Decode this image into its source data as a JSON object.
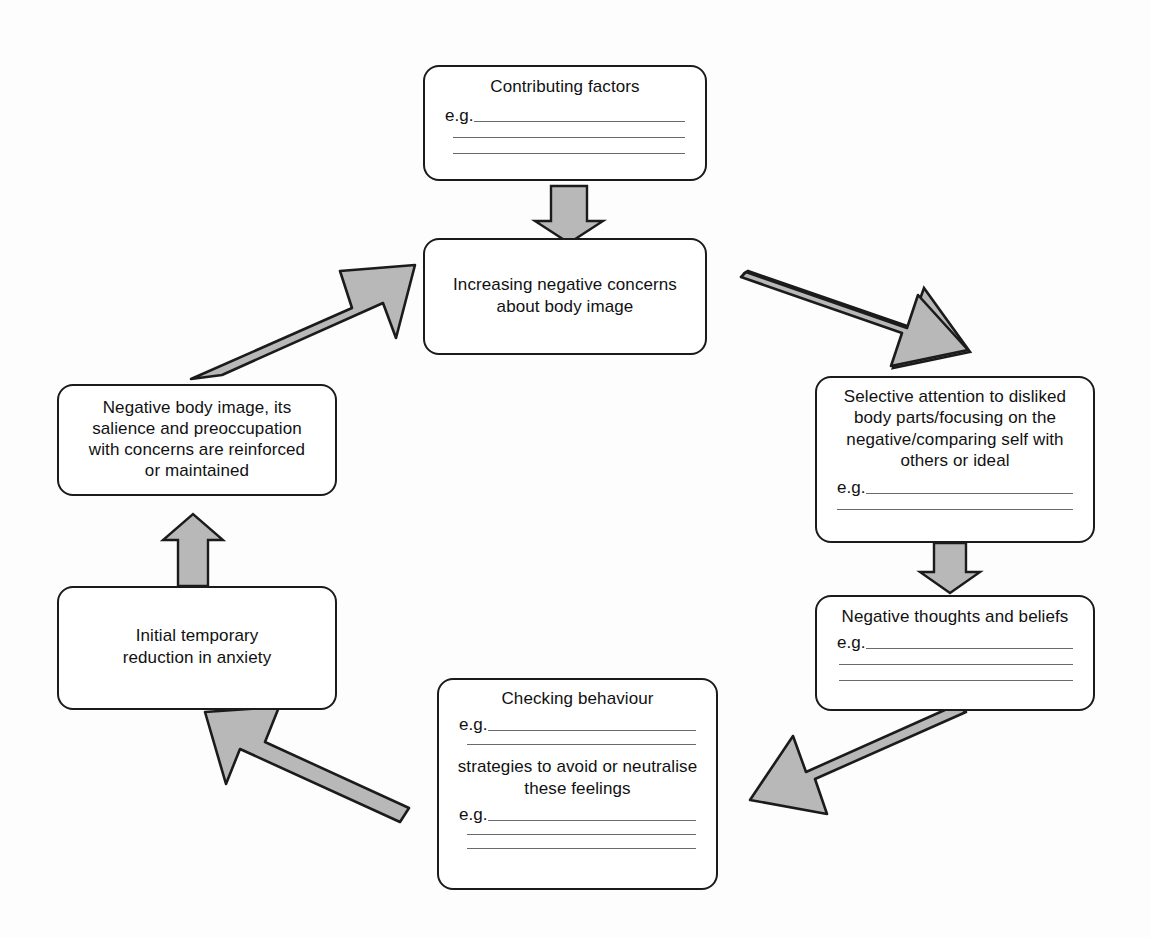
{
  "diagram": {
    "style": {
      "box_border": "#1b1b1b",
      "box_fill": "#ffffff",
      "arrow_fill": "#b8b8b8",
      "arrow_stroke": "#1b1b1b",
      "rule_color": "#6a6a6a",
      "text_color": "#111111",
      "background": "#fdfdfd"
    },
    "eg_label": "e.g.",
    "nodes": [
      {
        "id": "contributing-factors",
        "title": "Contributing factors",
        "eg_lines": 3
      },
      {
        "id": "increasing-negative-concerns",
        "title": "Increasing negative concerns about body image",
        "line1": "Increasing negative concerns",
        "line2": "about body image",
        "eg_lines": 0
      },
      {
        "id": "selective-attention",
        "title": "Selective attention to disliked body parts/focusing on the negative/comparing self with others or ideal",
        "line1": "Selective attention to disliked",
        "line2": "body parts/focusing on the",
        "line3": "negative/comparing self with",
        "line4": "others or ideal",
        "eg_lines": 2
      },
      {
        "id": "negative-thoughts",
        "title": "Negative thoughts and beliefs",
        "eg_lines": 3
      },
      {
        "id": "checking-behaviour",
        "title": "Checking behaviour",
        "eg_lines_first": 2,
        "subtitle_line1": "strategies to avoid or neutralise",
        "subtitle_line2": "these feelings",
        "eg_lines_second": 3
      },
      {
        "id": "initial-temporary-reduction",
        "title": "Initial temporary reduction in anxiety",
        "line1": "Initial temporary",
        "line2": "reduction in anxiety",
        "eg_lines": 0
      },
      {
        "id": "negative-body-image-reinforced",
        "title": "Negative body image, its salience and preoccupation with concerns are reinforced or maintained",
        "line1": "Negative body image, its",
        "line2": "salience and preoccupation",
        "line3": "with concerns are reinforced",
        "line4": "or maintained",
        "eg_lines": 0
      }
    ],
    "arrows": [
      {
        "id": "arrow-contributing-to-increasing",
        "from": "contributing-factors",
        "to": "increasing-negative-concerns",
        "direction": "down"
      },
      {
        "id": "arrow-increasing-to-selective",
        "from": "increasing-negative-concerns",
        "to": "selective-attention",
        "direction": "down-right"
      },
      {
        "id": "arrow-selective-to-thoughts",
        "from": "selective-attention",
        "to": "negative-thoughts",
        "direction": "down"
      },
      {
        "id": "arrow-thoughts-to-checking",
        "from": "negative-thoughts",
        "to": "checking-behaviour",
        "direction": "down-left"
      },
      {
        "id": "arrow-checking-to-initial",
        "from": "checking-behaviour",
        "to": "initial-temporary-reduction",
        "direction": "up-left"
      },
      {
        "id": "arrow-initial-to-negative-body-image",
        "from": "initial-temporary-reduction",
        "to": "negative-body-image-reinforced",
        "direction": "up"
      },
      {
        "id": "arrow-negative-body-image-to-increasing",
        "from": "negative-body-image-reinforced",
        "to": "increasing-negative-concerns",
        "direction": "up-right"
      }
    ]
  }
}
